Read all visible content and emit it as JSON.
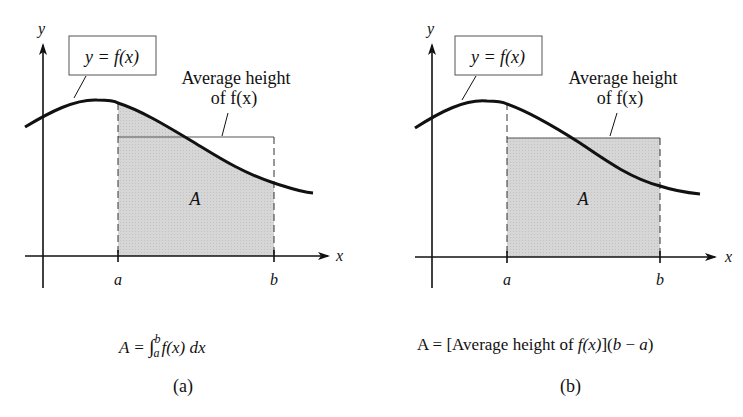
{
  "panels": [
    {
      "id": "a",
      "label": "(a)",
      "axis_labels": {
        "x": "x",
        "y": "y"
      },
      "curve_label": "y = f(x)",
      "avg_label_line1": "Average height",
      "avg_label_line2": "of f(x)",
      "area_label": "A",
      "tick_a": "a",
      "tick_b": "b",
      "shaded_region": "area under curve from a to b",
      "formula": {
        "lhs": "A = ",
        "integral_sign": "∫",
        "upper": "b",
        "lower": "a",
        "integrand": "f(x) dx"
      }
    },
    {
      "id": "b",
      "label": "(b)",
      "axis_labels": {
        "x": "x",
        "y": "y"
      },
      "curve_label": "y = f(x)",
      "avg_label_line1": "Average height",
      "avg_label_line2": "of f(x)",
      "area_label": "A",
      "tick_a": "a",
      "tick_b": "b",
      "shaded_region": "rectangle of average height from a to b",
      "formula": {
        "lhs": "A = [Average height of ",
        "fx": "f(x)",
        "rhs": "](",
        "b": "b",
        "minus": " − ",
        "a": "a",
        "close": ")"
      }
    }
  ],
  "colors": {
    "shade": "#d4d4d4",
    "ink": "#111111"
  }
}
